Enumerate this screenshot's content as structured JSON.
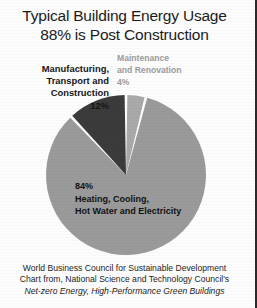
{
  "title": {
    "line1": "Typical Building Energy Usage",
    "line2": "88% is Post Construction"
  },
  "labels": {
    "manufacturing": {
      "line1": "Manufacturing,",
      "line2": "Transport and",
      "line3": "Construction",
      "value": "12%"
    },
    "maintenance": {
      "line1": "Maintenance",
      "line2": "and Renovation",
      "value": "4%"
    },
    "heating": {
      "value": "84%",
      "line1": "Heating, Cooling,",
      "line2": "Hot Water and Electricity"
    }
  },
  "source": {
    "line1": "World Business Council for Sustainable Development",
    "line2": "Chart from, National Science and Technology Council's",
    "line3": "Net-zero Energy, High-Performance Green Buildings"
  },
  "chart_data": {
    "type": "pie",
    "title": "Typical Building Energy Usage 88% is Post Construction",
    "subtitle": "",
    "xlabel": "",
    "ylabel": "",
    "legend": "none",
    "grid": false,
    "start_angle_deg": 0,
    "direction": "clockwise",
    "center": [
      126,
      175
    ],
    "radius": 80,
    "slice_gap_deg": 2,
    "categories": [
      "Maintenance and Renovation",
      "Heating, Cooling, Hot Water and Electricity",
      "Manufacturing, Transport and Construction"
    ],
    "values": [
      4,
      84,
      12
    ],
    "labels": [
      "4%",
      "84%",
      "12%"
    ],
    "colors": [
      "#a9a9a9",
      "#9a9a9a",
      "#3b3b3b"
    ],
    "label_colors": [
      "#9b9b9b",
      "#121212",
      "#161616"
    ],
    "annotations": [
      "88% is Post Construction",
      "World Business Council for Sustainable Development",
      "Chart from, National Science and Technology Council's",
      "Net-zero Energy, High-Performance Green Buildings"
    ]
  }
}
